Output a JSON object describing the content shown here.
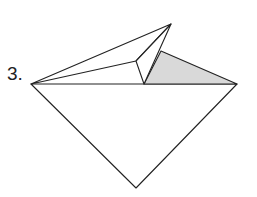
{
  "step": {
    "number_label": "3."
  },
  "diagram": {
    "colors": {
      "line": "#222222",
      "shade": "#d9d9d9",
      "paper": "#ffffff"
    }
  }
}
